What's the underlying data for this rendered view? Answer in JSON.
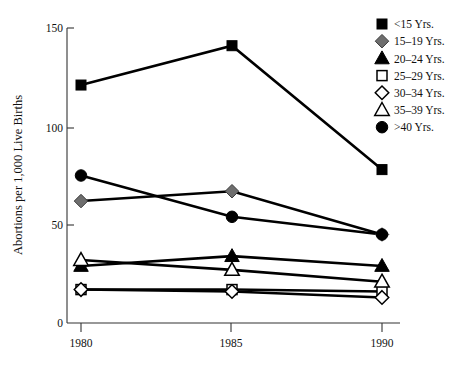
{
  "chart_data": {
    "type": "line",
    "title": "",
    "xlabel": "",
    "ylabel": "Abortions per 1,000 Live Births",
    "x": [
      1980,
      1985,
      1990
    ],
    "xticklabels": [
      "1980",
      "1985",
      "1990"
    ],
    "yticks": [
      0,
      50,
      100,
      150
    ],
    "yticklabels": [
      "0",
      "50",
      "100",
      "150"
    ],
    "ylim": [
      0,
      150
    ],
    "xlim": [
      1979,
      1991
    ],
    "grid": false,
    "legend_position": "top-right",
    "series": [
      {
        "name": "<15 Yrs.",
        "marker": "filled-square",
        "color": "#000000",
        "values": [
          121,
          141,
          78
        ]
      },
      {
        "name": "15–19 Yrs.",
        "marker": "filled-diamond",
        "color": "#6e6e6e",
        "values": [
          62,
          67,
          45
        ]
      },
      {
        "name": "20–24 Yrs.",
        "marker": "filled-triangle",
        "color": "#000000",
        "values": [
          29,
          34,
          29
        ]
      },
      {
        "name": "25–29 Yrs.",
        "marker": "open-square",
        "color": "#ffffff",
        "values": [
          17,
          17,
          16
        ]
      },
      {
        "name": "30–34 Yrs.",
        "marker": "open-diamond",
        "color": "#ffffff",
        "values": [
          17,
          16,
          13
        ]
      },
      {
        "name": "35–39 Yrs.",
        "marker": "open-triangle",
        "color": "#ffffff",
        "values": [
          32,
          27,
          21
        ]
      },
      {
        "name": ">40 Yrs.",
        "marker": "filled-circle",
        "color": "#000000",
        "values": [
          75,
          54,
          45
        ]
      }
    ]
  },
  "legend": {
    "entries": [
      {
        "label": "<15 Yrs."
      },
      {
        "label": "15–19 Yrs."
      },
      {
        "label": "20–24 Yrs."
      },
      {
        "label": "25–29 Yrs."
      },
      {
        "label": "30–34 Yrs."
      },
      {
        "label": "35–39 Yrs."
      },
      {
        "label": ">40 Yrs."
      }
    ]
  },
  "axes": {
    "y_title": "Abortions per 1,000 Live Births",
    "y_tick_0": "0",
    "y_tick_1": "50",
    "y_tick_2": "100",
    "y_tick_3": "150",
    "x_tick_0": "1980",
    "x_tick_1": "1985",
    "x_tick_2": "1990"
  }
}
